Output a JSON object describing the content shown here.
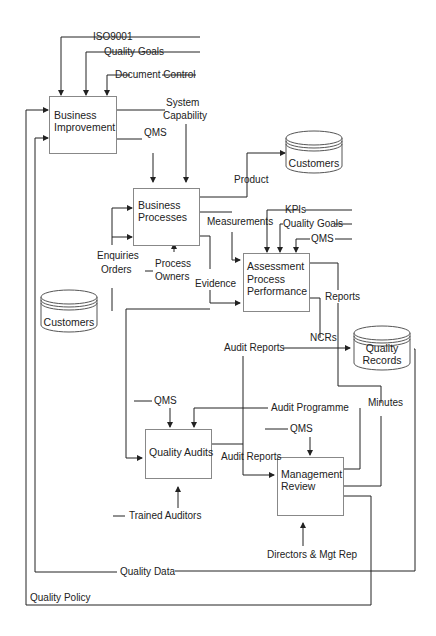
{
  "diagram": {
    "type": "process-flow",
    "processes": {
      "business_improvement": [
        "Business",
        "Improvement"
      ],
      "business_processes": [
        "Business",
        "Processes"
      ],
      "assessment": [
        "Assessment",
        "Process",
        "Performance"
      ],
      "quality_audits": "Quality Audits",
      "management_review": [
        "Management",
        "Review"
      ]
    },
    "stores": {
      "customers_top": "Customers",
      "customers_left": "Customers",
      "quality_records": [
        "Quality",
        "Records"
      ]
    },
    "labels": {
      "iso9001": "ISO9001",
      "quality_goals_top": "Quality Goals",
      "document_control": "Document Control",
      "system_capability": [
        "System",
        "Capability"
      ],
      "qms_bi": "QMS",
      "product": "Product",
      "measurements": "Measurements",
      "kpis": "KPIs",
      "quality_goals_ap": "Quality Goals",
      "qms_ap": "QMS",
      "enquiries": "Enquiries",
      "orders": "Orders",
      "process_owners": [
        "Process",
        "Owners"
      ],
      "evidence": "Evidence",
      "reports": "Reports",
      "ncrs": "NCRs",
      "audit_reports_top": "Audit Reports",
      "qms_qa": "QMS",
      "audit_programme": "Audit Programme",
      "minutes": "Minutes",
      "qms_mr": "QMS",
      "audit_reports_mid": "Audit Reports",
      "trained_auditors": "Trained Auditors",
      "directors": "Directors &  Mgt Rep",
      "quality_data": "Quality Data",
      "quality_policy": "Quality Policy"
    },
    "colors": {
      "line": "#222222",
      "box_border": "#888888",
      "background": "#ffffff"
    }
  }
}
